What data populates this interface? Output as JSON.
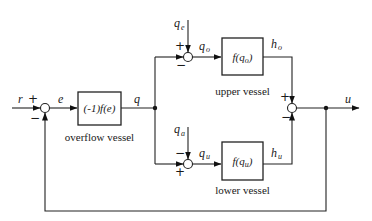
{
  "diagram": {
    "type": "block-diagram",
    "inputs": {
      "reference": "r",
      "error": "e",
      "flow": "q",
      "upper_disturbance": "q",
      "upper_disturbance_sub": "e",
      "lower_disturbance": "q",
      "lower_disturbance_sub": "a",
      "output": "u"
    },
    "blocks": {
      "overflow": {
        "label": "(-1)f(e)",
        "caption": "overflow vessel"
      },
      "upper": {
        "label_pre": "f(q",
        "label_sub": "o",
        "label_post": ")",
        "caption": "upper vessel"
      },
      "lower": {
        "label_pre": "f(q",
        "label_sub": "u",
        "label_post": ")",
        "caption": "lower vessel"
      }
    },
    "signals": {
      "q_o": "q",
      "q_o_sub": "o",
      "q_u": "q",
      "q_u_sub": "u",
      "h_o": "h",
      "h_o_sub": "o",
      "h_u": "h",
      "h_u_sub": "u"
    },
    "signs": {
      "sum1_top": "+",
      "sum1_bottom": "−",
      "upper_sum_top": "+",
      "upper_sum_left": "−",
      "lower_sum_top": "−",
      "lower_sum_left": "+",
      "out_sum_top": "+",
      "out_sum_bottom": "−"
    }
  }
}
